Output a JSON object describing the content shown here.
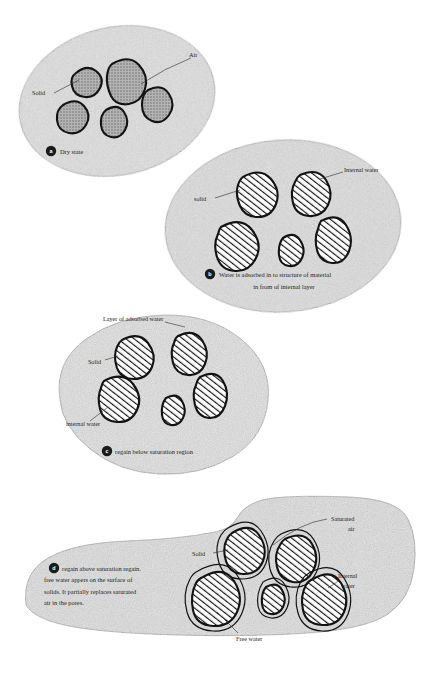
{
  "figure": {
    "background_color": "#ffffff",
    "matrix_fill": "#e4e4e4",
    "particle_gray": "#9d9d9d",
    "outline_color": "#121212"
  },
  "panels": [
    {
      "id": "a",
      "badge": "a",
      "caption": "Dry state",
      "shape": "ellipse",
      "particle_style": "solid-gray",
      "labels": [
        {
          "name": "solid",
          "text": "Solid"
        },
        {
          "name": "air",
          "text": "Air"
        }
      ]
    },
    {
      "id": "b",
      "badge": "b",
      "caption_line1": "Water is adsorbed in to structure of material",
      "caption_line2": "in from of internal layer",
      "shape": "ellipse",
      "particle_style": "hatched",
      "labels": [
        {
          "name": "solid",
          "text": "solid"
        },
        {
          "name": "internal-water",
          "text": "Internal water"
        }
      ]
    },
    {
      "id": "c",
      "badge": "c",
      "caption": "regain below saturation region",
      "shape": "blob-round",
      "particle_style": "hatched",
      "labels": [
        {
          "name": "layer-of-adsorbed-water",
          "text": "Layer of adsorbed water"
        },
        {
          "name": "solid",
          "text": "Solid"
        },
        {
          "name": "internal-water",
          "text": "internal water"
        }
      ]
    },
    {
      "id": "d",
      "badge": "d",
      "caption_line1": "regain above saturation regain.",
      "caption_line2": "free water appers on the surface of",
      "caption_line3": "solids. It partially replaces saturated",
      "caption_line4": "air in the pores.",
      "shape": "blob-lobed",
      "particle_style": "hatched-with-ring",
      "labels": [
        {
          "name": "saturated-air-line1",
          "text": "Saturated"
        },
        {
          "name": "saturated-air-line2",
          "text": "air"
        },
        {
          "name": "solid",
          "text": "Solid"
        },
        {
          "name": "internal-water-line1",
          "text": "Internal"
        },
        {
          "name": "internal-water-line2",
          "text": "water"
        },
        {
          "name": "free-water",
          "text": "Free water"
        }
      ]
    }
  ]
}
